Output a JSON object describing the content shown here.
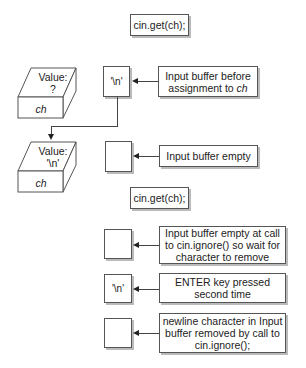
{
  "diagram": {
    "statements": [
      {
        "label": "cin.get(ch);"
      },
      {
        "label": "cin.get(ch);"
      }
    ],
    "variables": [
      {
        "value_label": "Value:",
        "value": "?",
        "name": "ch"
      },
      {
        "value_label": "Value:",
        "value": "'\\n'",
        "name": "ch"
      }
    ],
    "buffers": [
      {
        "content": "'\\n'",
        "note_pre": "Input buffer before assignment to ",
        "note_em": "ch"
      },
      {
        "content": "",
        "note": "Input buffer empty"
      },
      {
        "content": "",
        "note": "Input buffer empty at call to cin.ignore() so wait for character to remove"
      },
      {
        "content": "'\\n'",
        "note": "ENTER key pressed second time"
      },
      {
        "content": "",
        "note": "newline character in Input buffer removed by call to cin.ignore();"
      }
    ]
  }
}
